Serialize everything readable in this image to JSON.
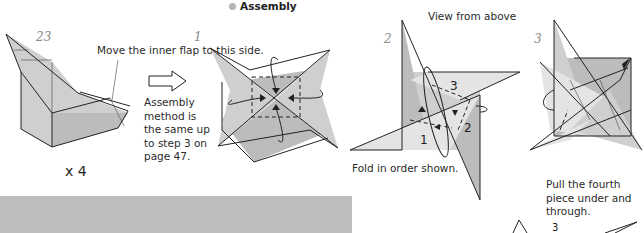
{
  "section": {
    "title": "Assembly",
    "bullet_color": "#b5b5b5"
  },
  "steps": [
    {
      "number": "23",
      "caption": "Move the inner flap to this side.",
      "multiplier": "x 4"
    },
    {
      "number": "1",
      "caption": "Assembly method is the same up to step 3 on page 47.",
      "caption_lines": [
        "Assembly",
        "method is",
        "the same up",
        "to step 3 on",
        "page 47."
      ]
    },
    {
      "number": "2",
      "header": "View from above",
      "caption": "Fold in order shown.",
      "fold_labels": [
        "1",
        "2",
        "3"
      ]
    },
    {
      "number": "3",
      "caption": "Pull the fourth piece under and through.",
      "caption_lines": [
        "Pull the fourth",
        "piece under and",
        "through."
      ]
    }
  ],
  "partial_next": {
    "label": "3"
  },
  "colors": {
    "paper_light": "#e4e4e4",
    "paper_mid": "#cfcfcf",
    "paper_dark": "#bcbcbc",
    "gray_bar": "#bdbdbd",
    "step_number": "#8a8a8a"
  }
}
